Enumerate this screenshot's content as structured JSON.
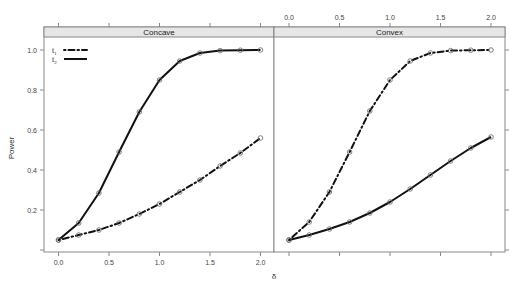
{
  "chart_data": {
    "type": "line",
    "title": "",
    "xlabel": "δ",
    "ylabel": "Power",
    "xlim": [
      -0.1,
      2.1
    ],
    "ylim": [
      0.0,
      1.05
    ],
    "x_ticks": [
      "0.0",
      "0.5",
      "1.0",
      "1.5",
      "2.0"
    ],
    "y_ticks": [
      "0.2",
      "0.4",
      "0.6",
      "0.8",
      "1.0"
    ],
    "grid": false,
    "legend": {
      "position": "top-left inside first panel",
      "entries": [
        {
          "label": "t",
          "subscript": "1",
          "style": "dot-dash"
        },
        {
          "label": "t",
          "subscript": "2",
          "style": "solid"
        }
      ]
    },
    "x": [
      0.0,
      0.2,
      0.4,
      0.6,
      0.8,
      1.0,
      1.2,
      1.4,
      1.6,
      1.8,
      2.0
    ],
    "panels": [
      {
        "title": "Concave",
        "series": [
          {
            "name": "t1",
            "style": "dot-dash",
            "values": [
              0.05,
              0.075,
              0.1,
              0.135,
              0.18,
              0.23,
              0.29,
              0.35,
              0.42,
              0.485,
              0.56
            ]
          },
          {
            "name": "t2",
            "style": "solid",
            "values": [
              0.05,
              0.135,
              0.285,
              0.49,
              0.69,
              0.85,
              0.945,
              0.985,
              0.997,
              0.999,
              1.0
            ]
          }
        ]
      },
      {
        "title": "Convex",
        "series": [
          {
            "name": "t1",
            "style": "dot-dash",
            "values": [
              0.05,
              0.14,
              0.29,
              0.49,
              0.695,
              0.85,
              0.945,
              0.985,
              0.997,
              0.999,
              1.0
            ]
          },
          {
            "name": "t2",
            "style": "solid",
            "values": [
              0.05,
              0.075,
              0.105,
              0.14,
              0.185,
              0.24,
              0.305,
              0.375,
              0.445,
              0.51,
              0.565
            ]
          }
        ]
      }
    ]
  },
  "colors": {
    "line": "#111111",
    "marker": "#666666",
    "frame": "#888888",
    "strip": "#e6e6e6",
    "background": "#ffffff"
  }
}
